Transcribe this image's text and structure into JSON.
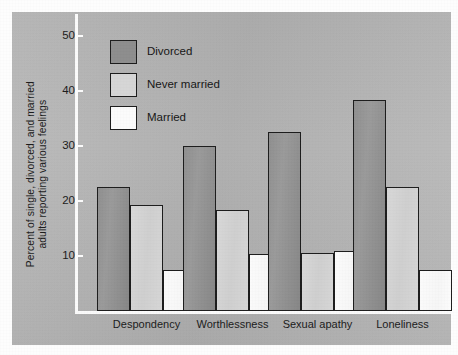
{
  "chart_data": {
    "type": "bar",
    "title": "",
    "subtitle": "",
    "xlabel": "",
    "ylabel": "Percent of single, divorced, and married adults reporting various feelings",
    "ylabel_line1": "Percent of single, divorced, and married",
    "ylabel_line2": "adults reporting various feelings",
    "categories": [
      "Despondency",
      "Worthlessness",
      "Sexual apathy",
      "Loneliness"
    ],
    "series": [
      {
        "name": "Divorced",
        "color": "#8d8d8d",
        "values": [
          22.5,
          30.0,
          32.5,
          38.3
        ]
      },
      {
        "name": "Never married",
        "color": "#d6d6d6",
        "values": [
          19.2,
          18.4,
          10.6,
          22.5
        ]
      },
      {
        "name": "Married",
        "color": "#fbfbfb",
        "values": [
          7.4,
          10.4,
          10.9,
          7.5
        ]
      }
    ],
    "ylim": [
      0,
      53
    ],
    "yticks": [
      10,
      20,
      30,
      40,
      50
    ],
    "ytick_labels": [
      "10",
      "20",
      "30",
      "40",
      "50"
    ],
    "grid": false,
    "legend_position": "upper-left-inside",
    "background_color": "#b6b6b6",
    "axis_color": "#fbfbfb",
    "bar_outline_color": "#1c1c1c"
  },
  "legend": {
    "items": [
      {
        "label": "Divorced",
        "swatch": "divorced"
      },
      {
        "label": "Never married",
        "swatch": "never"
      },
      {
        "label": "Married",
        "swatch": "married"
      }
    ]
  }
}
